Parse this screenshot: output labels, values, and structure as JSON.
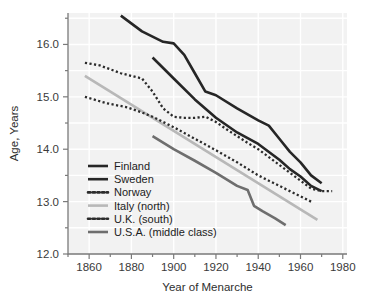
{
  "chart_data": {
    "type": "line",
    "title": "",
    "xlabel": "Year of Menarche",
    "ylabel": "Age, Years",
    "xlim": [
      1850,
      1982
    ],
    "ylim": [
      12.0,
      16.6
    ],
    "xticks": [
      1860,
      1880,
      1900,
      1920,
      1940,
      1960,
      1980
    ],
    "xtick_labels": [
      "1860",
      "1880",
      "1900",
      "1920",
      "1940",
      "1960",
      "1980"
    ],
    "xticks_minor": [
      1850,
      1870,
      1890,
      1910,
      1930,
      1950,
      1970
    ],
    "yticks": [
      12.0,
      13.0,
      14.0,
      15.0,
      16.0
    ],
    "ytick_labels": [
      "12.0",
      "13.0",
      "14.0",
      "15.0",
      "16.0"
    ],
    "yticks_minor": [
      12.5,
      13.5,
      14.5,
      15.5,
      16.5
    ],
    "grid": true,
    "grid_color": "#ffffff",
    "plot_background": "#f2f2f2",
    "legend_position": "lower-left-inside",
    "series": [
      {
        "name": "Finland",
        "color": "#262626",
        "style": "solid",
        "width": 2.6,
        "x": [
          1875,
          1885,
          1895,
          1900,
          1905,
          1910,
          1915,
          1920,
          1930,
          1940,
          1945,
          1950,
          1955,
          1960,
          1965,
          1970
        ],
        "y": [
          16.55,
          16.25,
          16.05,
          16.02,
          15.8,
          15.45,
          15.1,
          15.03,
          14.78,
          14.55,
          14.45,
          14.2,
          13.95,
          13.75,
          13.5,
          13.35
        ]
      },
      {
        "name": "Sweden",
        "color": "#262626",
        "style": "solid",
        "width": 2.6,
        "x": [
          1890,
          1900,
          1910,
          1920,
          1930,
          1940,
          1950,
          1955,
          1960,
          1965,
          1970
        ],
        "y": [
          15.75,
          15.35,
          14.95,
          14.6,
          14.32,
          14.1,
          13.8,
          13.62,
          13.48,
          13.3,
          13.2
        ]
      },
      {
        "name": "Norway",
        "color": "#2b2b2b",
        "style": "dotted",
        "width": 2.3,
        "x": [
          1858,
          1865,
          1875,
          1885,
          1890,
          1895,
          1900,
          1905,
          1910,
          1915,
          1920,
          1925,
          1930,
          1935,
          1940,
          1945,
          1950,
          1955,
          1960,
          1965,
          1970,
          1975
        ],
        "y": [
          15.65,
          15.6,
          15.45,
          15.35,
          15.1,
          14.78,
          14.62,
          14.6,
          14.6,
          14.62,
          14.52,
          14.38,
          14.25,
          14.12,
          14.0,
          13.85,
          13.7,
          13.55,
          13.4,
          13.25,
          13.2,
          13.2
        ]
      },
      {
        "name": "Italy (north)",
        "color": "#b8b8b8",
        "style": "solid",
        "width": 2.6,
        "x": [
          1858,
          1968
        ],
        "y": [
          15.4,
          12.65
        ]
      },
      {
        "name": "U.K. (south)",
        "color": "#2b2b2b",
        "style": "dotted",
        "width": 2.3,
        "x": [
          1858,
          1868,
          1878,
          1885,
          1890,
          1900,
          1910,
          1920,
          1930,
          1940,
          1950,
          1955,
          1960,
          1965
        ],
        "y": [
          15.0,
          14.88,
          14.8,
          14.7,
          14.62,
          14.42,
          14.2,
          13.98,
          13.75,
          13.5,
          13.3,
          13.2,
          13.1,
          13.0
        ]
      },
      {
        "name": "U.S.A. (middle class)",
        "color": "#6e6e6e",
        "style": "solid",
        "width": 2.6,
        "x": [
          1890,
          1900,
          1910,
          1920,
          1930,
          1935,
          1938,
          1942,
          1948,
          1953
        ],
        "y": [
          14.25,
          14.0,
          13.78,
          13.55,
          13.3,
          13.22,
          12.92,
          12.82,
          12.68,
          12.55
        ]
      }
    ]
  },
  "legend": {
    "items": [
      {
        "label": "Finland",
        "color": "#262626",
        "style": "solid"
      },
      {
        "label": "Sweden",
        "color": "#262626",
        "style": "solid"
      },
      {
        "label": "Norway",
        "color": "#2b2b2b",
        "style": "dotted"
      },
      {
        "label": "Italy (north)",
        "color": "#b8b8b8",
        "style": "solid"
      },
      {
        "label": "U.K. (south)",
        "color": "#2b2b2b",
        "style": "dotted"
      },
      {
        "label": "U.S.A. (middle class)",
        "color": "#6e6e6e",
        "style": "solid"
      }
    ]
  }
}
